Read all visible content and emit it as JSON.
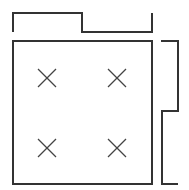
{
  "diagram": {
    "stroke_color": "#333333",
    "background": "#ffffff",
    "main_square": {
      "x": 13,
      "y": 41,
      "width": 139,
      "height": 143
    },
    "top_bracket_points": "13,32 13,13 82,13 82,32 152,32 152,13",
    "right_bracket_points": "161,41 178,41 178,111 162,111 162,184 178,184",
    "markers": [
      {
        "label": "x-marker-top-left",
        "cx": 47,
        "cy": 78
      },
      {
        "label": "x-marker-top-right",
        "cx": 117,
        "cy": 78
      },
      {
        "label": "x-marker-bottom-left",
        "cx": 47,
        "cy": 148
      },
      {
        "label": "x-marker-bottom-right",
        "cx": 117,
        "cy": 148
      }
    ],
    "marker_half_size": 9
  }
}
